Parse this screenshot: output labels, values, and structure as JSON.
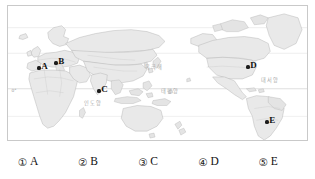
{
  "figure": {
    "name": "world-map",
    "projection": "pacific-centered world map",
    "land_color": "#e8e8e8",
    "land_outline_color": "#b0b0b0",
    "border_color": "#c9c9c9",
    "graticule_color": "#c4c4c4"
  },
  "map": {
    "latitude_labels": [
      {
        "text": "0°",
        "x": 3.5,
        "y": 82.5
      }
    ],
    "ocean_labels": [
      {
        "name": "indian-ocean-label",
        "text": "인도양",
        "x": 76,
        "y": 95
      },
      {
        "name": "pacific-ocean-label",
        "text": "태평양",
        "x": 153,
        "y": 83
      },
      {
        "name": "atlantic-ocean-label",
        "text": "대서양",
        "x": 253,
        "y": 72
      },
      {
        "name": "arctic-area-label",
        "text": "북극해",
        "x": 137,
        "y": 59
      }
    ],
    "points": [
      {
        "name": "point-a",
        "label": "A",
        "x": 31,
        "y": 62,
        "region": "western-mediterranean-europe"
      },
      {
        "name": "point-b",
        "label": "B",
        "x": 48,
        "y": 57,
        "region": "central-europe"
      },
      {
        "name": "point-c",
        "label": "C",
        "x": 91,
        "y": 85,
        "region": "south-asia-bay-of-bengal"
      },
      {
        "name": "point-d",
        "label": "D",
        "x": 240,
        "y": 61,
        "region": "eastern-united-states"
      },
      {
        "name": "point-e",
        "label": "E",
        "x": 259,
        "y": 116,
        "region": "southeastern-south-america"
      }
    ]
  },
  "answers": {
    "name": "answer-choices",
    "options": [
      {
        "number": "①",
        "label": "A"
      },
      {
        "number": "②",
        "label": "B"
      },
      {
        "number": "③",
        "label": "C"
      },
      {
        "number": "④",
        "label": "D"
      },
      {
        "number": "⑤",
        "label": "E"
      }
    ]
  }
}
